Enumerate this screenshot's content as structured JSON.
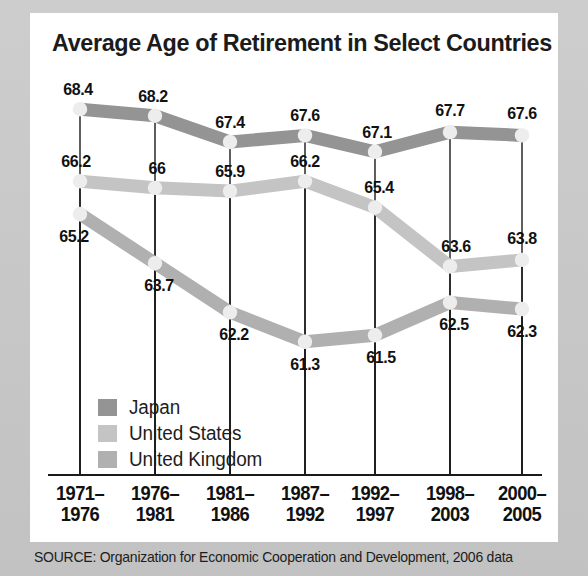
{
  "chart_data": {
    "type": "line",
    "title": "Average Age of Retirement in Select Countries",
    "xlabel": "",
    "ylabel": "",
    "ylim": [
      60.5,
      69.2
    ],
    "grid": false,
    "legend_position": "inside-lower-left",
    "categories": [
      "1971–1976",
      "1976–1981",
      "1981–1986",
      "1987–1992",
      "1992–1997",
      "1998–2003",
      "2000–2005"
    ],
    "category_lines": [
      [
        "1971–",
        "1976"
      ],
      [
        "1976–",
        "1981"
      ],
      [
        "1981–",
        "1986"
      ],
      [
        "1987–",
        "1992"
      ],
      [
        "1992–",
        "1997"
      ],
      [
        "1998–",
        "2003"
      ],
      [
        "2000–",
        "2005"
      ]
    ],
    "series": [
      {
        "name": "Japan",
        "color": "#949494",
        "values": [
          68.4,
          68.2,
          67.4,
          67.6,
          67.1,
          67.7,
          67.6
        ],
        "labels": [
          "68.4",
          "68.2",
          "67.4",
          "67.6",
          "67.1",
          "67.7",
          "67.6"
        ]
      },
      {
        "name": "United States",
        "color": "#c4c4c4",
        "values": [
          66.2,
          66.0,
          65.9,
          66.2,
          65.4,
          63.6,
          63.8
        ],
        "labels": [
          "66.2",
          "66",
          "65.9",
          "66.2",
          "65.4",
          "63.6",
          "63.8"
        ]
      },
      {
        "name": "United Kingdom",
        "color": "#b0b0b0",
        "values": [
          65.2,
          63.7,
          62.2,
          61.3,
          61.5,
          62.5,
          62.3
        ],
        "labels": [
          "65.2",
          "63.7",
          "62.2",
          "61.3",
          "61.5",
          "62.5",
          "62.3"
        ]
      }
    ],
    "source": "SOURCE: Organization for Economic Cooperation and Development, 2006 data"
  },
  "legend": {
    "items": [
      {
        "label": "Japan",
        "color": "#949494"
      },
      {
        "label": "United States",
        "color": "#c4c4c4"
      },
      {
        "label": "United Kingdom",
        "color": "#b0b0b0"
      }
    ]
  },
  "colors": {
    "japan": "#949494",
    "united_states": "#c4c4c4",
    "united_kingdom": "#b0b0b0",
    "card_background": "#ffffff",
    "page_background": "#c8c8c8",
    "text": "#111111",
    "axis": "#1a1a1a"
  }
}
